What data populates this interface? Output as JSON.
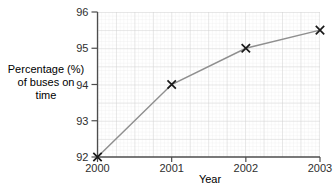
{
  "chart_data": {
    "type": "line",
    "title": "",
    "xlabel": "Year",
    "ylabel_lines": [
      "Percentage (%)",
      "of buses on",
      "time"
    ],
    "series": [
      {
        "name": "Percentage of buses on time",
        "x": [
          2000,
          2001,
          2002,
          2003
        ],
        "values": [
          92,
          94,
          95,
          95.5
        ]
      }
    ],
    "x_ticks": [
      2000,
      2001,
      2002,
      2003
    ],
    "y_ticks": [
      92,
      93,
      94,
      95,
      96
    ],
    "xlim": [
      2000,
      2003
    ],
    "ylim": [
      92,
      96
    ],
    "marker": "x",
    "grid": "fine graph paper, bold line every 5 minor cells",
    "legend": "none",
    "colors": {
      "line": "#8f8f8f",
      "marker": "#1a1a1a",
      "axis": "#4d4d4d",
      "grid_minor": "#e7e7e7",
      "grid_major": "#cfcfcf",
      "text": "#2e2e2e",
      "background": "#ffffff"
    }
  }
}
